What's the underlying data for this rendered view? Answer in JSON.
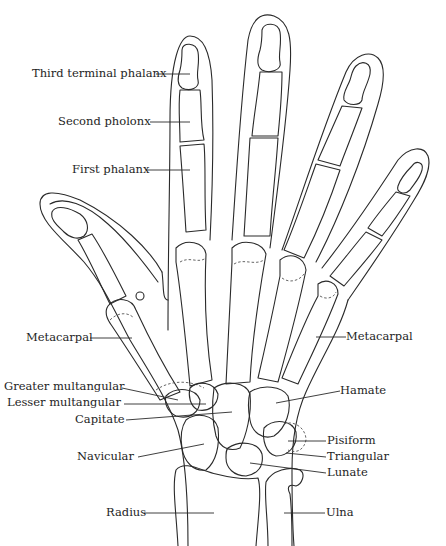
{
  "diagram": {
    "ink_color": "#2a2a2a",
    "background": "#ffffff",
    "labels": {
      "third_terminal_phalanx": "Third terminal phalanx",
      "second_phalanx": "Second pholonx",
      "first_phalanx": "First phalanx",
      "metacarpal_left": "Metacarpal",
      "metacarpal_right": "Metacarpal",
      "greater_multangular": "Greater multangular",
      "lesser_multangular": "Lesser multangular",
      "capitate": "Capitate",
      "navicular": "Navicular",
      "hamate": "Hamate",
      "pisiform": "Pisiform",
      "triangular": "Triangular",
      "lunate": "Lunate",
      "radius": "Radius",
      "ulna": "Ulna"
    }
  }
}
